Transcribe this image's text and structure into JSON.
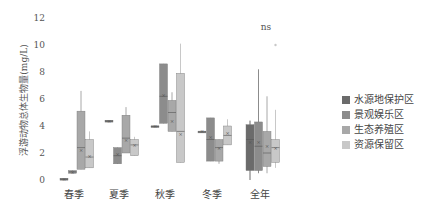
{
  "chart_data": {
    "type": "box",
    "title": "",
    "ylabel": "浮游动物总体生物量(mg/L)",
    "xlabel": "",
    "ylim": [
      0,
      12
    ],
    "yticks": [
      0,
      2,
      4,
      6,
      8,
      10,
      12
    ],
    "grid": false,
    "legend_position": "right",
    "categories": [
      "春季",
      "夏季",
      "秋季",
      "冬季",
      "全年"
    ],
    "annotations": [
      {
        "category": "全年",
        "text": "ns"
      }
    ],
    "series": [
      {
        "name": "水源地保护区",
        "color": "#6b6b6b",
        "boxes": [
          {
            "min": 0.1,
            "q1": 0.1,
            "median": 0.1,
            "q3": 0.1,
            "max": 0.1,
            "mean": 0.1
          },
          {
            "min": 4.4,
            "q1": 4.4,
            "median": 4.4,
            "q3": 4.4,
            "max": 4.4,
            "mean": 4.4
          },
          {
            "min": 4.0,
            "q1": 4.0,
            "median": 4.0,
            "q3": 4.0,
            "max": 4.0,
            "mean": 4.0
          },
          {
            "min": 3.6,
            "q1": 3.6,
            "median": 3.6,
            "q3": 3.6,
            "max": 3.6,
            "mean": 3.6
          },
          {
            "min": 0.0,
            "q1": 0.7,
            "median": 3.0,
            "q3": 4.1,
            "max": 4.4,
            "mean": 2.8
          }
        ]
      },
      {
        "name": "景观娱乐区",
        "color": "#8c8c8c",
        "boxes": [
          {
            "min": 0.5,
            "q1": 0.5,
            "median": 0.6,
            "q3": 0.7,
            "max": 0.7,
            "mean": 0.6
          },
          {
            "min": 1.2,
            "q1": 1.2,
            "median": 1.8,
            "q3": 2.4,
            "max": 2.4,
            "mean": 1.9
          },
          {
            "min": 4.2,
            "q1": 4.2,
            "median": 6.2,
            "q3": 8.6,
            "max": 8.6,
            "mean": 6.3
          },
          {
            "min": 1.4,
            "q1": 1.4,
            "median": 3.0,
            "q3": 4.6,
            "max": 4.6,
            "mean": 3.2
          },
          {
            "min": 0.5,
            "q1": 0.7,
            "median": 2.5,
            "q3": 4.3,
            "max": 8.2,
            "mean": 2.8
          }
        ]
      },
      {
        "name": "生态养殖区",
        "color": "#a8a8a8",
        "boxes": [
          {
            "min": 0.8,
            "q1": 0.8,
            "median": 2.4,
            "q3": 5.1,
            "max": 6.6,
            "mean": 2.2
          },
          {
            "min": 2.0,
            "q1": 2.0,
            "median": 3.1,
            "q3": 4.8,
            "max": 5.4,
            "mean": 3.0
          },
          {
            "min": 3.6,
            "q1": 3.6,
            "median": 5.0,
            "q3": 5.9,
            "max": 6.5,
            "mean": 4.4
          },
          {
            "min": 1.2,
            "q1": 1.4,
            "median": 2.4,
            "q3": 3.0,
            "max": 3.0,
            "mean": 2.4
          },
          {
            "min": 0.5,
            "q1": 1.0,
            "median": 2.0,
            "q3": 3.6,
            "max": 6.2,
            "mean": 2.5
          }
        ]
      },
      {
        "name": "资源保留区",
        "color": "#c8c8c8",
        "boxes": [
          {
            "min": 0.9,
            "q1": 0.9,
            "median": 1.7,
            "q3": 3.0,
            "max": 3.6,
            "mean": 1.8
          },
          {
            "min": 1.8,
            "q1": 1.8,
            "median": 2.6,
            "q3": 3.0,
            "max": 3.2,
            "mean": 2.6
          },
          {
            "min": 1.3,
            "q1": 1.3,
            "median": 3.6,
            "q3": 7.9,
            "max": 10.1,
            "mean": 3.4
          },
          {
            "min": 2.6,
            "q1": 2.6,
            "median": 3.3,
            "q3": 4.0,
            "max": 4.5,
            "mean": 3.5
          },
          {
            "min": 0.9,
            "q1": 1.3,
            "median": 2.4,
            "q3": 3.0,
            "max": 5.2,
            "mean": 2.4,
            "outliers": [
              10.0
            ]
          }
        ]
      }
    ]
  },
  "legend": {
    "items": [
      {
        "label": "水源地保护区",
        "color": "#6b6b6b"
      },
      {
        "label": "景观娱乐区",
        "color": "#8c8c8c"
      },
      {
        "label": "生态养殖区",
        "color": "#a8a8a8"
      },
      {
        "label": "资源保留区",
        "color": "#c8c8c8"
      }
    ]
  }
}
